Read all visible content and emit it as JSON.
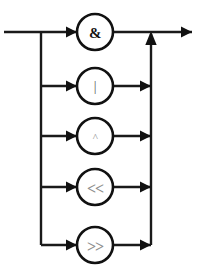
{
  "diagram": {
    "type": "railroad-syntax-diagram",
    "width": 198,
    "height": 278,
    "background_color": "#ffffff",
    "line_color": "#1a1a1a",
    "node_fill_color": "#ffffff",
    "node_stroke_color": "#111111",
    "entry_label": "",
    "exit_label": "",
    "geometry": {
      "entry_x": 4,
      "split_bus_x": 41,
      "merge_bus_x": 151,
      "node_center_x": 95,
      "node_radius": 18,
      "exit_x": 192
    },
    "branches": [
      {
        "id": "branch-and",
        "symbol": "&",
        "name": "bitwise-and",
        "row_y": 32,
        "style": "amp",
        "is_main_line": true
      },
      {
        "id": "branch-or",
        "symbol": "|",
        "name": "bitwise-or",
        "row_y": 86,
        "style": "pipe",
        "is_main_line": false
      },
      {
        "id": "branch-xor",
        "symbol": "^",
        "name": "bitwise-xor",
        "row_y": 136,
        "style": "caret",
        "is_main_line": false
      },
      {
        "id": "branch-shift-left",
        "symbol": "<<",
        "name": "shift-left",
        "row_y": 187,
        "style": "shift",
        "is_main_line": false
      },
      {
        "id": "branch-shift-right",
        "symbol": ">>",
        "name": "shift-right",
        "row_y": 245,
        "style": "shift",
        "is_main_line": false
      }
    ]
  }
}
